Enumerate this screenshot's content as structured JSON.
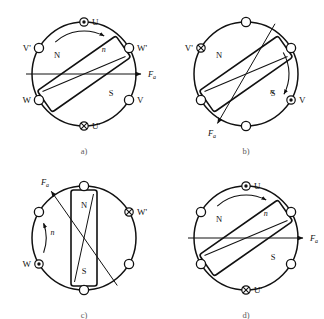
{
  "figure": {
    "background_color": "#ffffff",
    "line_color": "#111111",
    "width": 324,
    "height": 319
  },
  "symbols": {
    "current_out_of_page": "circle-dot",
    "current_into_page": "circle-cross",
    "no_current": "circle-empty"
  },
  "labels": {
    "pole_north": "N",
    "pole_south": "S",
    "rotation_speed": "n",
    "armature_mmf": "F",
    "armature_mmf_subscript": "a",
    "terminal_u": "U",
    "terminal_u_prime": "U'",
    "terminal_v": "V",
    "terminal_v_prime": "V'",
    "terminal_w": "W",
    "terminal_w_prime": "W'"
  },
  "panels": [
    {
      "id": "a",
      "caption": "a)",
      "center": {
        "x": 84,
        "y": 74
      },
      "radius": 52,
      "rotor_angle_deg": -35,
      "rotor_length": 96,
      "rotor_width": 26,
      "pole_n_label": "N",
      "pole_s_label": "S",
      "fa_label": "F",
      "fa_sub": "a",
      "fa_angle_deg": 0,
      "rotation_label": "n",
      "slots": [
        {
          "name": "slot-u",
          "label": "U",
          "angle_deg": 90,
          "state": "circle-dot",
          "label_side": "right"
        },
        {
          "name": "slot-w-prime",
          "label": "W'",
          "angle_deg": 30,
          "state": "circle-empty",
          "label_side": "right"
        },
        {
          "name": "slot-v",
          "label": "V",
          "angle_deg": -30,
          "state": "circle-empty",
          "label_side": "right"
        },
        {
          "name": "slot-u-prime",
          "label": "U'",
          "angle_deg": -90,
          "state": "circle-cross",
          "label_side": "right"
        },
        {
          "name": "slot-w",
          "label": "W",
          "angle_deg": -150,
          "state": "circle-empty",
          "label_side": "left"
        },
        {
          "name": "slot-v-prime",
          "label": "V'",
          "angle_deg": 150,
          "state": "circle-empty",
          "label_side": "left"
        }
      ]
    },
    {
      "id": "b",
      "caption": "b)",
      "center": {
        "x": 246,
        "y": 74
      },
      "radius": 52,
      "rotor_angle_deg": -35,
      "rotor_length": 96,
      "rotor_width": 26,
      "pole_n_label": "N",
      "pole_s_label": "S",
      "fa_label": "F",
      "fa_sub": "a",
      "fa_angle_deg": -120,
      "rotation_label": "n",
      "slots": [
        {
          "name": "slot-top",
          "label": "",
          "angle_deg": 90,
          "state": "circle-empty",
          "label_side": "right"
        },
        {
          "name": "slot-ur",
          "label": "",
          "angle_deg": 30,
          "state": "circle-empty",
          "label_side": "right"
        },
        {
          "name": "slot-v",
          "label": "V",
          "angle_deg": -30,
          "state": "circle-dot",
          "label_side": "right"
        },
        {
          "name": "slot-bottom",
          "label": "",
          "angle_deg": -90,
          "state": "circle-empty",
          "label_side": "right"
        },
        {
          "name": "slot-ll",
          "label": "",
          "angle_deg": -150,
          "state": "circle-empty",
          "label_side": "left"
        },
        {
          "name": "slot-v-prime",
          "label": "V'",
          "angle_deg": 150,
          "state": "circle-cross",
          "label_side": "left"
        }
      ]
    },
    {
      "id": "c",
      "caption": "c)",
      "center": {
        "x": 84,
        "y": 238
      },
      "radius": 52,
      "rotor_angle_deg": -90,
      "rotor_length": 96,
      "rotor_width": 26,
      "pole_n_label": "N",
      "pole_s_label": "S",
      "fa_label": "F",
      "fa_sub": "a",
      "fa_angle_deg": 125,
      "rotation_label": "n",
      "slots": [
        {
          "name": "slot-top",
          "label": "",
          "angle_deg": 90,
          "state": "circle-empty",
          "label_side": "right"
        },
        {
          "name": "slot-w-prime",
          "label": "W'",
          "angle_deg": 30,
          "state": "circle-cross",
          "label_side": "right"
        },
        {
          "name": "slot-lr",
          "label": "",
          "angle_deg": -30,
          "state": "circle-empty",
          "label_side": "right"
        },
        {
          "name": "slot-bottom",
          "label": "",
          "angle_deg": -90,
          "state": "circle-empty",
          "label_side": "right"
        },
        {
          "name": "slot-w",
          "label": "W",
          "angle_deg": -150,
          "state": "circle-dot",
          "label_side": "left"
        },
        {
          "name": "slot-ul",
          "label": "",
          "angle_deg": 150,
          "state": "circle-empty",
          "label_side": "left"
        }
      ]
    },
    {
      "id": "d",
      "caption": "d)",
      "center": {
        "x": 246,
        "y": 238
      },
      "radius": 52,
      "rotor_angle_deg": -35,
      "rotor_length": 96,
      "rotor_width": 26,
      "pole_n_label": "N",
      "pole_s_label": "S",
      "fa_label": "F",
      "fa_sub": "a",
      "fa_angle_deg": 0,
      "rotation_label": "n",
      "slots": [
        {
          "name": "slot-u",
          "label": "U",
          "angle_deg": 90,
          "state": "circle-dot",
          "label_side": "right"
        },
        {
          "name": "slot-ur",
          "label": "",
          "angle_deg": 30,
          "state": "circle-empty",
          "label_side": "right"
        },
        {
          "name": "slot-lr",
          "label": "",
          "angle_deg": -30,
          "state": "circle-empty",
          "label_side": "right"
        },
        {
          "name": "slot-u-prime",
          "label": "U'",
          "angle_deg": -90,
          "state": "circle-cross",
          "label_side": "right"
        },
        {
          "name": "slot-ll",
          "label": "",
          "angle_deg": -150,
          "state": "circle-empty",
          "label_side": "left"
        },
        {
          "name": "slot-ul",
          "label": "",
          "angle_deg": 150,
          "state": "circle-empty",
          "label_side": "left"
        }
      ]
    }
  ],
  "captions": {
    "a": "a)",
    "b": "b)",
    "c": "c)",
    "d": "d)"
  }
}
